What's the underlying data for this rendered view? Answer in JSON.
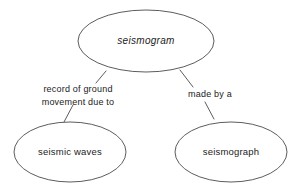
{
  "diagram": {
    "type": "concept-map",
    "background_color": "#ffffff",
    "stroke_color": "#4a4a4a",
    "text_color": "#222222",
    "nodes": [
      {
        "id": "root",
        "label": "seismogram",
        "style": "italic",
        "shape": "ellipse",
        "cx": 146,
        "cy": 41,
        "rx": 68,
        "ry": 31
      },
      {
        "id": "left",
        "label": "seismic waves",
        "style": "normal",
        "shape": "ellipse",
        "cx": 70,
        "cy": 152,
        "rx": 56,
        "ry": 30
      },
      {
        "id": "right",
        "label": "seismograph",
        "style": "normal",
        "shape": "ellipse",
        "cx": 231,
        "cy": 152,
        "rx": 56,
        "ry": 30
      }
    ],
    "edges": [
      {
        "id": "edge-left",
        "from": "root",
        "to": "left",
        "label_lines": [
          "record of ground",
          "movement due to"
        ],
        "label_x": 78,
        "label_y": 92
      },
      {
        "id": "edge-right",
        "from": "root",
        "to": "right",
        "label_lines": [
          "made by a"
        ],
        "label_x": 210,
        "label_y": 97
      }
    ]
  }
}
